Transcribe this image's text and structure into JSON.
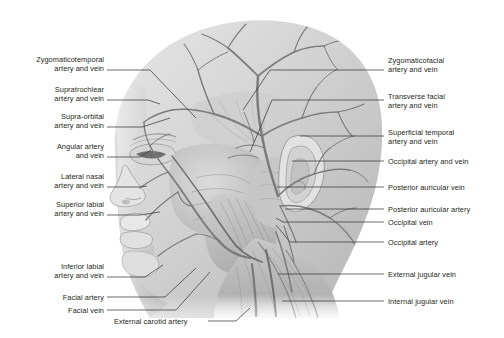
{
  "figure": {
    "type": "anatomical-illustration",
    "view": "lateral view of head and neck",
    "style": "grayscale medical illustration",
    "colors": {
      "background": "#ffffff",
      "skin_light": "#e3e3e3",
      "skin_mid": "#c9c9c9",
      "skin_shadow": "#a8a8a8",
      "vessel": "#7d7d7d",
      "vessel_dark": "#616161",
      "muscle": "#bdbdbd",
      "leader_line": "#3a3a3a",
      "text": "#231f20"
    }
  },
  "labels_left": [
    {
      "id": "zygomaticotemporal",
      "lines": [
        "Zygomaticotemporal",
        "artery and vein"
      ],
      "x": 8,
      "y": 55,
      "width": 96,
      "leader": {
        "x1": 107,
        "y1": 70,
        "x2": 150,
        "y2": 70,
        "x3": 196,
        "y3": 118
      }
    },
    {
      "id": "supratrochlear",
      "lines": [
        "Supratrochlear",
        "artery and vein"
      ],
      "x": 8,
      "y": 85,
      "width": 96,
      "leader": {
        "x1": 107,
        "y1": 100,
        "x2": 148,
        "y2": 100,
        "x3": 160,
        "y3": 104
      }
    },
    {
      "id": "supra-orbital",
      "lines": [
        "Supra-orbital",
        "artery and vein"
      ],
      "x": 8,
      "y": 112,
      "width": 96,
      "leader": {
        "x1": 107,
        "y1": 127,
        "x2": 142,
        "y2": 127,
        "x3": 170,
        "y3": 118
      }
    },
    {
      "id": "angular",
      "lines": [
        "Angular artery",
        "and vein"
      ],
      "x": 8,
      "y": 142,
      "width": 96,
      "leader": {
        "x1": 107,
        "y1": 157,
        "x2": 140,
        "y2": 157,
        "x3": 151,
        "y3": 150
      }
    },
    {
      "id": "lateral-nasal",
      "lines": [
        "Lateral nasal",
        "artery and vein"
      ],
      "x": 8,
      "y": 172,
      "width": 96,
      "leader": {
        "x1": 107,
        "y1": 187,
        "x2": 140,
        "y2": 187,
        "x3": 147,
        "y3": 186
      }
    },
    {
      "id": "superior-labial",
      "lines": [
        "Superior labial",
        "artery and vein"
      ],
      "x": 8,
      "y": 200,
      "width": 96,
      "leader": {
        "x1": 107,
        "y1": 215,
        "x2": 140,
        "y2": 215,
        "x3": 160,
        "y3": 212
      }
    },
    {
      "id": "inferior-labial",
      "lines": [
        "Inferior labial",
        "artery and vein"
      ],
      "x": 8,
      "y": 262,
      "width": 96,
      "leader": {
        "x1": 107,
        "y1": 277,
        "x2": 145,
        "y2": 277,
        "x3": 163,
        "y3": 265
      }
    },
    {
      "id": "facial-artery",
      "lines": [
        "Facial artery"
      ],
      "x": 8,
      "y": 293,
      "width": 96,
      "leader": {
        "x1": 107,
        "y1": 297,
        "x2": 165,
        "y2": 297,
        "x3": 196,
        "y3": 268
      }
    },
    {
      "id": "facial-vein",
      "lines": [
        "Facial vein"
      ],
      "x": 8,
      "y": 306,
      "width": 96,
      "leader": {
        "x1": 107,
        "y1": 310,
        "x2": 176,
        "y2": 310,
        "x3": 210,
        "y3": 272
      }
    }
  ],
  "labels_center": [
    {
      "id": "external-carotid-artery",
      "lines": [
        "External carotid artery"
      ],
      "x": 114,
      "y": 317,
      "width": 90,
      "leader": {
        "x1": 208,
        "y1": 321,
        "x2": 236,
        "y2": 321,
        "x3": 250,
        "y3": 308
      }
    }
  ],
  "labels_right": [
    {
      "id": "zygomaticofacial",
      "lines": [
        "Zygomaticofacial",
        "artery and vein"
      ],
      "x": 388,
      "y": 56,
      "width": 110,
      "leader": {
        "x1": 384,
        "y1": 70,
        "x2": 270,
        "y2": 70,
        "x3": 243,
        "y3": 110
      }
    },
    {
      "id": "transverse-facial",
      "lines": [
        "Transverse facial",
        "artery and vein"
      ],
      "x": 388,
      "y": 92,
      "width": 110,
      "leader": {
        "x1": 384,
        "y1": 100,
        "x2": 272,
        "y2": 100,
        "x3": 250,
        "y3": 152
      }
    },
    {
      "id": "superficial-temporal",
      "lines": [
        "Superficial temporal",
        "artery and vein"
      ],
      "x": 388,
      "y": 128,
      "width": 110,
      "leader": {
        "x1": 384,
        "y1": 136,
        "x2": 300,
        "y2": 136,
        "x3": 300,
        "y3": 136
      }
    },
    {
      "id": "occipital-artery-and-vein",
      "lines": [
        "Occipital artery and vein"
      ],
      "x": 388,
      "y": 157,
      "width": 110,
      "leader": {
        "x1": 384,
        "y1": 161,
        "x2": 292,
        "y2": 161,
        "x3": 292,
        "y3": 161
      }
    },
    {
      "id": "posterior-auricular-vein",
      "lines": [
        "Posterior auricular vein"
      ],
      "x": 388,
      "y": 183,
      "width": 110,
      "leader": {
        "x1": 384,
        "y1": 187,
        "x2": 277,
        "y2": 187,
        "x3": 277,
        "y3": 187
      }
    },
    {
      "id": "posterior-auricular-artery",
      "lines": [
        "Posterior auricular artery"
      ],
      "x": 388,
      "y": 205,
      "width": 110,
      "leader": {
        "x1": 384,
        "y1": 209,
        "x2": 285,
        "y2": 209,
        "x3": 285,
        "y3": 209
      }
    },
    {
      "id": "occipital-vein",
      "lines": [
        "Occipital vein"
      ],
      "x": 388,
      "y": 218,
      "width": 110,
      "leader": {
        "x1": 384,
        "y1": 222,
        "x2": 283,
        "y2": 222,
        "x3": 276,
        "y3": 218
      }
    },
    {
      "id": "occipital-artery",
      "lines": [
        "Occipital artery"
      ],
      "x": 388,
      "y": 238,
      "width": 110,
      "leader": {
        "x1": 384,
        "y1": 242,
        "x2": 290,
        "y2": 242,
        "x3": 276,
        "y3": 225
      }
    },
    {
      "id": "external-jugular-vein",
      "lines": [
        "External jugular vein"
      ],
      "x": 388,
      "y": 270,
      "width": 110,
      "leader": {
        "x1": 384,
        "y1": 274,
        "x2": 278,
        "y2": 274,
        "x3": 278,
        "y3": 274
      }
    },
    {
      "id": "internal-jugular-vein",
      "lines": [
        "Internal jugular vein"
      ],
      "x": 388,
      "y": 297,
      "width": 110,
      "leader": {
        "x1": 384,
        "y1": 301,
        "x2": 282,
        "y2": 301,
        "x3": 282,
        "y3": 301
      }
    }
  ]
}
